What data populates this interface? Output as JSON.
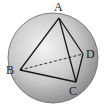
{
  "diagram": {
    "sphere": {
      "cx": 53,
      "cy": 58,
      "r": 45,
      "fill_light": "#f2f2f2",
      "fill_dark": "#9a9a9a",
      "stroke": "#555555"
    },
    "vertices": {
      "A": {
        "label": "A",
        "x": 59,
        "y": 18,
        "lx": 54,
        "ly": 11
      },
      "B": {
        "label": "B",
        "x": 20,
        "y": 70,
        "lx": 6,
        "ly": 74
      },
      "C": {
        "label": "C",
        "x": 76,
        "y": 82,
        "lx": 69,
        "ly": 95
      },
      "D": {
        "label": "D",
        "x": 83,
        "y": 54,
        "lx": 86,
        "ly": 58
      }
    },
    "solid_edges": [
      "AB",
      "AC",
      "AD",
      "BC",
      "CD"
    ],
    "dashed_edges": [
      "BD"
    ],
    "edge_color": "#1a1a1a"
  }
}
